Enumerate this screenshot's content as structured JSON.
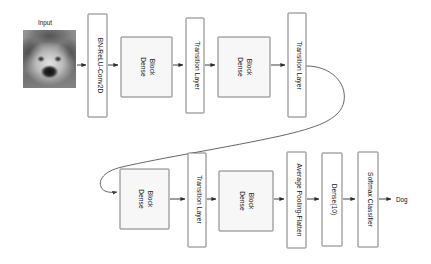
{
  "diagram": {
    "background_color": "#ffffff",
    "box_fill_shaded": "#f7f7f7",
    "box_fill_plain": "#ffffff",
    "box_stroke": "#6e6e6e",
    "arrow_color": "#2b2b2b"
  },
  "input": {
    "label": "Input",
    "image_alt": "grayscale photo of a shaggy dog face"
  },
  "row1": {
    "nodes": [
      {
        "label": "BN-ReLU-Conv2D",
        "style": "plain"
      },
      {
        "label": "Dense\nBlock",
        "line1": "Dense",
        "line2": "Block",
        "style": "shaded"
      },
      {
        "label": "Transition Layer",
        "style": "plain"
      },
      {
        "label": "Dense\nBlock",
        "line1": "Dense",
        "line2": "Block",
        "style": "shaded"
      },
      {
        "label": "Transition Layer",
        "style": "plain"
      }
    ]
  },
  "row2": {
    "nodes": [
      {
        "label": "Dense\nBlock",
        "line1": "Dense",
        "line2": "Block",
        "style": "shaded"
      },
      {
        "label": "Transition Layer",
        "style": "plain"
      },
      {
        "label": "Dense\nBlock",
        "line1": "Dense",
        "line2": "Block",
        "style": "shaded"
      },
      {
        "label": "Average Pooling-Flatten",
        "style": "plain"
      },
      {
        "label": "Dense(10)",
        "style": "plain"
      },
      {
        "label": "Softmax Classifier",
        "style": "plain"
      }
    ]
  },
  "output": {
    "label": "Dog"
  }
}
